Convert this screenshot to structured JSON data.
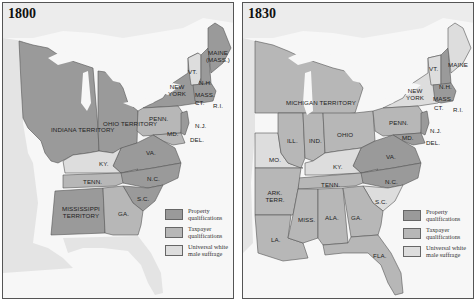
{
  "colors": {
    "property": "#9a9a9a",
    "taxpayer": "#b7b7b7",
    "universal": "#dddddd",
    "water": "#f7f7f7",
    "land_other": "#ececec",
    "border": "#555555"
  },
  "legend": {
    "items": [
      {
        "key": "property",
        "label": "Property qualifications"
      },
      {
        "key": "taxpayer",
        "label": "Taxpayer qualifications"
      },
      {
        "key": "universal",
        "label": "Universal white male suffrage"
      }
    ]
  },
  "maps": [
    {
      "year": "1800",
      "labels": {
        "indiana": "INDIANA TERRITORY",
        "ohio": "OHIO TERRITORY",
        "penn": "PENN.",
        "newyork": "NEW YORK",
        "vt": "VT.",
        "nh": "N.H.",
        "maine": "MAINE (MASS.)",
        "mass": "MASS.",
        "ct": "CT.",
        "ri": "R.I.",
        "nj": "N.J.",
        "md": "MD.",
        "del": "DEL.",
        "va": "VA.",
        "ky": "KY.",
        "tenn": "TENN.",
        "nc": "N.C.",
        "sc": "S.C.",
        "mississippi": "MISSISSIPPI TERRITORY",
        "ga": "GA."
      },
      "states": {
        "property": [
          "Indiana Territory",
          "Ohio Territory",
          "New York",
          "N.H.",
          "Maine (Mass.)",
          "Mass.",
          "Ct.",
          "R.I.",
          "N.J.",
          "Va.",
          "N.C.",
          "S.C.",
          "Mississippi Territory"
        ],
        "taxpayer": [
          "Penn.",
          "Md.",
          "Del.",
          "Tenn.",
          "Ga."
        ],
        "universal": [
          "Vt.",
          "Ky."
        ]
      }
    },
    {
      "year": "1830",
      "labels": {
        "michigan": "MICHIGAN TERRITORY",
        "ill": "ILL.",
        "ind": "IND.",
        "ohio": "OHIO",
        "penn": "PENN.",
        "newyork": "NEW YORK",
        "vt": "VT.",
        "nh": "N.H.",
        "maine": "MAINE",
        "mass": "MASS.",
        "ct": "CT.",
        "ri": "R.I.",
        "nj": "N.J.",
        "md": "MD.",
        "del": "DEL.",
        "va": "VA.",
        "mo": "MO.",
        "ky": "KY.",
        "tenn": "TENN.",
        "nc": "N.C.",
        "sc": "S.C.",
        "ark": "ARK. TERR.",
        "miss": "MISS.",
        "ala": "ALA.",
        "ga": "GA.",
        "la": "LA.",
        "fla": "FLA."
      },
      "states": {
        "property": [
          "Va.",
          "N.C.",
          "N.H.",
          "Mass.",
          "Ct.",
          "R.I.",
          "Md.",
          "Del.",
          "N.J."
        ],
        "taxpayer": [
          "Michigan Territory",
          "Ill.",
          "Ind.",
          "Ohio",
          "Penn.",
          "Tenn.",
          "Ark. Terr.",
          "Miss.",
          "Ala.",
          "Ga.",
          "La.",
          "Fla."
        ],
        "universal": [
          "New York",
          "Vt.",
          "Maine",
          "Mo.",
          "Ky.",
          "S.C."
        ]
      }
    }
  ]
}
